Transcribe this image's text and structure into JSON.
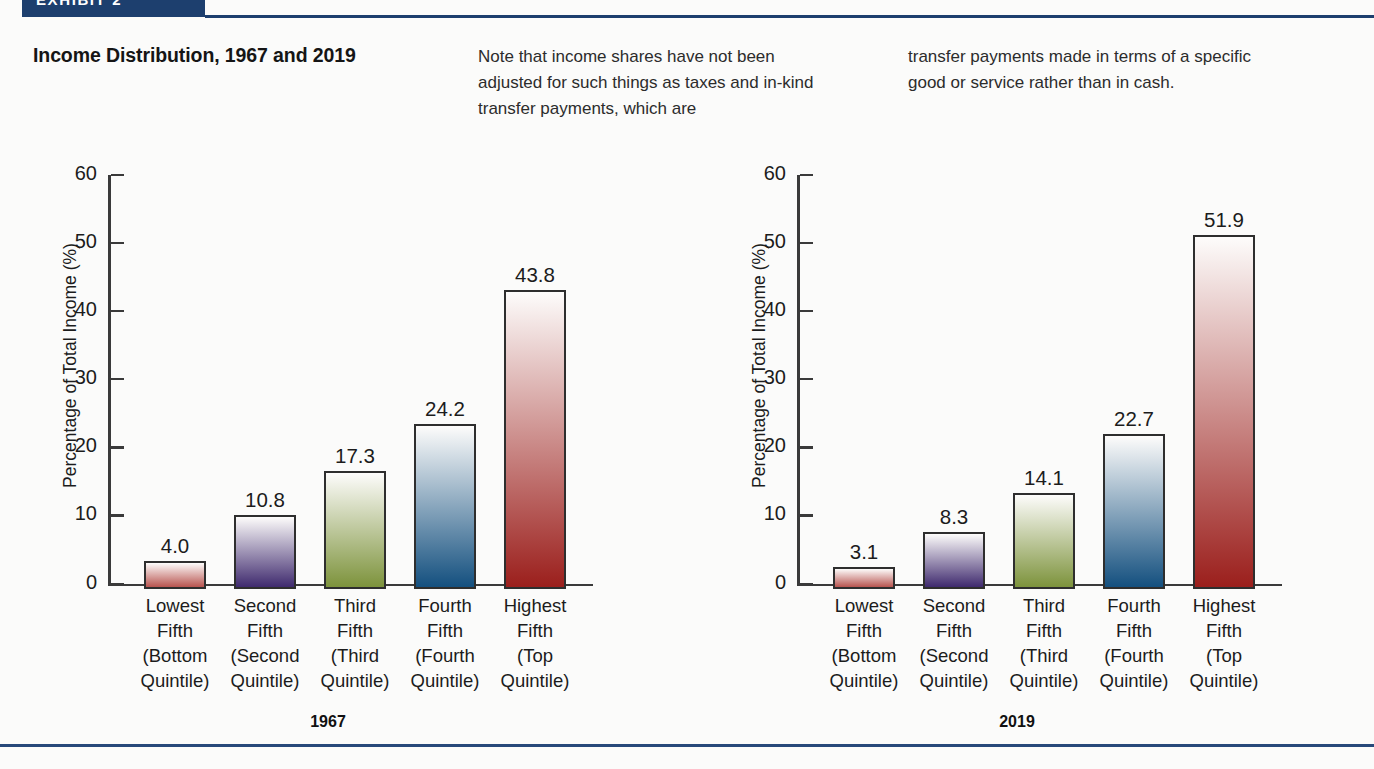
{
  "exhibit": {
    "band_label": "EXHIBIT 2",
    "title": "Income Distribution, 1967 and 2019"
  },
  "notes": {
    "column_1": "Note that income shares have not been adjusted for such things as taxes and in-kind transfer payments, which are",
    "column_2": "transfer payments made in terms of a specific good or service rather than in cash."
  },
  "colors": {
    "band": "#1d3f6e",
    "rule": "#28497a",
    "bar_rose": "#b8544f",
    "bar_purple": "#3f2a6e",
    "bar_green": "#7d933c",
    "bar_blue": "#14507f",
    "bar_red": "#9b1f1c"
  },
  "chart_data": [
    {
      "type": "bar",
      "title": "1967",
      "xlabel": "",
      "ylabel": "Percentage of Total Income (%)",
      "ylim": [
        0,
        60
      ],
      "yticks": [
        0,
        10,
        20,
        30,
        40,
        50,
        60
      ],
      "grid": false,
      "legend": "none",
      "categories": [
        "Lowest\nFifth\n(Bottom\nQuintile)",
        "Second\nFifth\n(Second\nQuintile)",
        "Third\nFifth\n(Third\nQuintile)",
        "Fourth\nFifth\n(Fourth\nQuintile)",
        "Highest\nFifth\n(Top\nQuintile)"
      ],
      "category_lines": [
        [
          "Lowest",
          "Fifth",
          "(Bottom",
          "Quintile)"
        ],
        [
          "Second",
          "Fifth",
          "(Second",
          "Quintile)"
        ],
        [
          "Third",
          "Fifth",
          "(Third",
          "Quintile)"
        ],
        [
          "Fourth",
          "Fifth",
          "(Fourth",
          "Quintile)"
        ],
        [
          "Highest",
          "Fifth",
          "(Top",
          "Quintile)"
        ]
      ],
      "values": [
        4.0,
        10.8,
        17.3,
        24.2,
        43.8
      ],
      "value_labels": [
        "4.0",
        "10.8",
        "17.3",
        "24.2",
        "43.8"
      ],
      "bar_colors": [
        "#b8544f",
        "#3f2a6e",
        "#7d933c",
        "#14507f",
        "#9b1f1c"
      ]
    },
    {
      "type": "bar",
      "title": "2019",
      "xlabel": "",
      "ylabel": "Percentage of Total Income (%)",
      "ylim": [
        0,
        60
      ],
      "yticks": [
        0,
        10,
        20,
        30,
        40,
        50,
        60
      ],
      "grid": false,
      "legend": "none",
      "categories": [
        "Lowest\nFifth\n(Bottom\nQuintile)",
        "Second\nFifth\n(Second\nQuintile)",
        "Third\nFifth\n(Third\nQuintile)",
        "Fourth\nFifth\n(Fourth\nQuintile)",
        "Highest\nFifth\n(Top\nQuintile)"
      ],
      "category_lines": [
        [
          "Lowest",
          "Fifth",
          "(Bottom",
          "Quintile)"
        ],
        [
          "Second",
          "Fifth",
          "(Second",
          "Quintile)"
        ],
        [
          "Third",
          "Fifth",
          "(Third",
          "Quintile)"
        ],
        [
          "Fourth",
          "Fifth",
          "(Fourth",
          "Quintile)"
        ],
        [
          "Highest",
          "Fifth",
          "(Top",
          "Quintile)"
        ]
      ],
      "values": [
        3.1,
        8.3,
        14.1,
        22.7,
        51.9
      ],
      "value_labels": [
        "3.1",
        "8.3",
        "14.1",
        "22.7",
        "51.9"
      ],
      "bar_colors": [
        "#b8544f",
        "#3f2a6e",
        "#7d933c",
        "#14507f",
        "#9b1f1c"
      ]
    }
  ]
}
